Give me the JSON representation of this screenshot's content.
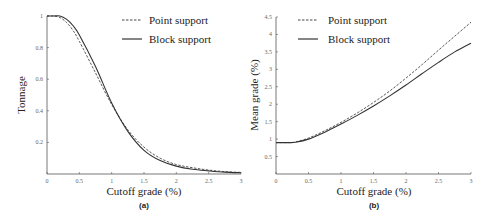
{
  "chart_data": [
    {
      "id": "a",
      "type": "line",
      "panel_label": "(a)",
      "xlabel": "Cutoff grade (%)",
      "ylabel": "Tonnage",
      "xlim": [
        0,
        3
      ],
      "ylim": [
        0,
        1
      ],
      "xticks": [
        "0",
        "0.5",
        "1",
        "1.5",
        "2",
        "2.5",
        "3"
      ],
      "yticks": [
        "0.2",
        "0.4",
        "0.6",
        "0.8",
        "1"
      ],
      "grid": false,
      "legend_position": "upper right",
      "x": [
        0,
        0.1,
        0.2,
        0.3,
        0.4,
        0.5,
        0.75,
        1.0,
        1.25,
        1.5,
        1.75,
        2.0,
        2.25,
        2.5,
        2.75,
        3.0
      ],
      "series": [
        {
          "name": "Point support",
          "style": "dashed",
          "values": [
            1.0,
            1.0,
            0.99,
            0.96,
            0.91,
            0.84,
            0.64,
            0.44,
            0.28,
            0.17,
            0.1,
            0.06,
            0.04,
            0.025,
            0.015,
            0.01
          ]
        },
        {
          "name": "Block support",
          "style": "solid",
          "values": [
            1.0,
            1.0,
            1.0,
            0.98,
            0.94,
            0.88,
            0.68,
            0.45,
            0.27,
            0.15,
            0.085,
            0.05,
            0.03,
            0.02,
            0.012,
            0.008
          ]
        }
      ]
    },
    {
      "id": "b",
      "type": "line",
      "panel_label": "(b)",
      "xlabel": "Cutoff grade (%)",
      "ylabel": "Mean grade (%)",
      "xlim": [
        0,
        3
      ],
      "ylim": [
        0,
        4.5
      ],
      "xticks": [
        "0",
        "0.5",
        "1",
        "1.5",
        "2",
        "2.5",
        "3"
      ],
      "yticks": [
        "0.5",
        "1",
        "1.5",
        "2",
        "2.5",
        "3",
        "3.5",
        "4",
        "4.5"
      ],
      "grid": false,
      "legend_position": "upper left",
      "x": [
        0,
        0.1,
        0.2,
        0.3,
        0.5,
        0.75,
        1.0,
        1.25,
        1.5,
        1.75,
        2.0,
        2.25,
        2.5,
        2.75,
        3.0
      ],
      "series": [
        {
          "name": "Point support",
          "style": "dashed",
          "values": [
            0.9,
            0.9,
            0.9,
            0.92,
            1.03,
            1.24,
            1.48,
            1.75,
            2.05,
            2.38,
            2.75,
            3.14,
            3.55,
            3.95,
            4.35
          ]
        },
        {
          "name": "Block support",
          "style": "solid",
          "values": [
            0.9,
            0.9,
            0.9,
            0.91,
            1.0,
            1.2,
            1.43,
            1.68,
            1.95,
            2.24,
            2.55,
            2.88,
            3.2,
            3.5,
            3.75
          ]
        }
      ]
    }
  ],
  "legend": {
    "point_label": "Point support",
    "block_label": "Block support"
  },
  "colors": {
    "axis": "#555555",
    "line": "#333333",
    "dashed_line": "#444444"
  }
}
